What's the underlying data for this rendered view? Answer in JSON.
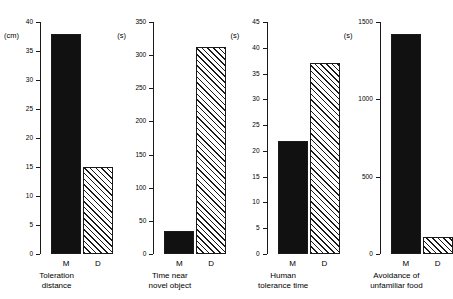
{
  "figure": {
    "categories": [
      "M",
      "D"
    ],
    "panels": [
      {
        "unit": "(cm)",
        "caption": "Toleration\ndistance",
        "ymin": 0,
        "ymax": 40,
        "ticks": [
          "0",
          "5",
          "10",
          "15",
          "20",
          "25",
          "30",
          "35",
          "40"
        ],
        "tick_values": [
          0,
          5,
          10,
          15,
          20,
          25,
          30,
          35,
          40
        ],
        "values": [
          38,
          15
        ],
        "fills": [
          "solid",
          "hatched"
        ]
      },
      {
        "unit": "(s)",
        "caption": "Time near\nnovel object",
        "ymin": 0,
        "ymax": 350,
        "ticks": [
          "0",
          "50",
          "100",
          "150",
          "200",
          "250",
          "300",
          "350"
        ],
        "tick_values": [
          0,
          50,
          100,
          150,
          200,
          250,
          300,
          350
        ],
        "values": [
          35,
          313
        ],
        "fills": [
          "solid",
          "hatched"
        ]
      },
      {
        "unit": "(s)",
        "caption": "Human\ntolerance time",
        "ymin": 0,
        "ymax": 45,
        "ticks": [
          "0",
          "5",
          "10",
          "15",
          "20",
          "25",
          "30",
          "35",
          "40",
          "45"
        ],
        "tick_values": [
          0,
          5,
          10,
          15,
          20,
          25,
          30,
          35,
          40,
          45
        ],
        "values": [
          22,
          37
        ],
        "fills": [
          "solid",
          "hatched"
        ]
      },
      {
        "unit": "(s)",
        "caption": "Avoidance of\nunfamiliar food",
        "ymin": 0,
        "ymax": 1500,
        "ticks": [
          "0",
          "500",
          "1000",
          "1500"
        ],
        "tick_values": [
          0,
          500,
          1000,
          1500
        ],
        "values": [
          1420,
          110
        ],
        "fills": [
          "solid",
          "hatched"
        ]
      }
    ]
  },
  "chart_data": {
    "type": "bar",
    "title": "",
    "xlabel": "",
    "ylabel": "",
    "categories": [
      "M",
      "D"
    ],
    "grid": false,
    "legend": "none",
    "panels": [
      {
        "title": "Toleration distance",
        "ylabel": "(cm)",
        "ylim": [
          0,
          40
        ],
        "yticks": [
          0,
          5,
          10,
          15,
          20,
          25,
          30,
          35,
          40
        ],
        "categories": [
          "M",
          "D"
        ],
        "values": [
          38,
          15
        ]
      },
      {
        "title": "Time near novel object",
        "ylabel": "(s)",
        "ylim": [
          0,
          350
        ],
        "yticks": [
          0,
          50,
          100,
          150,
          200,
          250,
          300,
          350
        ],
        "categories": [
          "M",
          "D"
        ],
        "values": [
          35,
          313
        ]
      },
      {
        "title": "Human tolerance time",
        "ylabel": "(s)",
        "ylim": [
          0,
          45
        ],
        "yticks": [
          0,
          5,
          10,
          15,
          20,
          25,
          30,
          35,
          40,
          45
        ],
        "categories": [
          "M",
          "D"
        ],
        "values": [
          22,
          37
        ]
      },
      {
        "title": "Avoidance of unfamiliar food",
        "ylabel": "(s)",
        "ylim": [
          0,
          1500
        ],
        "yticks": [
          0,
          500,
          1000,
          1500
        ],
        "categories": [
          "M",
          "D"
        ],
        "values": [
          1420,
          110
        ]
      }
    ]
  }
}
